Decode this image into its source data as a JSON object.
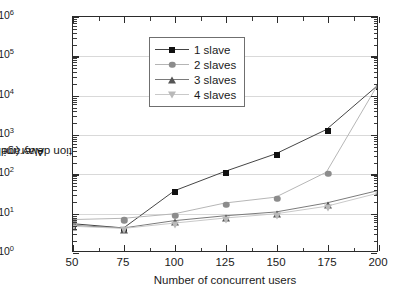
{
  "chart_data": {
    "type": "line",
    "title": "",
    "xlabel": "Number of concurrent users",
    "ylabel": "Average relative\nreplication delay (millisecond)",
    "ylabel_line1": "Average relative",
    "ylabel_line2": "replication delay (millisecond)",
    "x": [
      50,
      75,
      100,
      125,
      150,
      175,
      200
    ],
    "xlim": [
      50,
      200
    ],
    "xticks": [
      "50",
      "75",
      "100",
      "125",
      "150",
      "175",
      "200"
    ],
    "yscale": "log",
    "ylim": [
      1,
      1000000
    ],
    "yticks": [
      "10<sup>0</sup>",
      "10<sup>1</sup>",
      "10<sup>2</sup>",
      "10<sup>3</sup>",
      "10<sup>4</sup>",
      "10<sup>5</sup>",
      "10<sup>6</sup>"
    ],
    "ytick_values": [
      1,
      10,
      100,
      1000,
      10000,
      100000,
      1000000
    ],
    "grid": true,
    "legend_position": "upper-left",
    "series": [
      {
        "name": "1 slave",
        "marker": "square",
        "color": "#111111",
        "line_color": "#444444",
        "values": [
          5.0,
          3.9,
          35,
          110,
          310,
          1300,
          17000
        ]
      },
      {
        "name": "2 slaves",
        "marker": "circle",
        "color": "#8c8c8c",
        "line_color": "#b5b5b5",
        "values": [
          6.4,
          6.9,
          9.0,
          17,
          24,
          105,
          17000
        ]
      },
      {
        "name": "3 slaves",
        "marker": "triangle-up",
        "color": "#555555",
        "line_color": "#7a7a7a",
        "values": [
          4.5,
          3.9,
          6.0,
          8.0,
          10.0,
          17.0,
          35.0
        ]
      },
      {
        "name": "4 slaves",
        "marker": "triangle-down",
        "color": "#b9b9b9",
        "line_color": "#c9c9c9",
        "values": [
          4.3,
          3.8,
          5.2,
          7.0,
          9.0,
          14.0,
          30.0
        ]
      }
    ]
  }
}
